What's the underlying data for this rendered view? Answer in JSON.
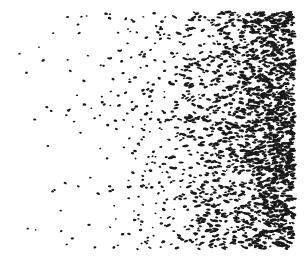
{
  "image": {
    "description": "Stippled dot-density gradient: sparse black dots on the left becoming dense elongated marks on the right",
    "width": 307,
    "height": 261,
    "background": "#ffffff",
    "ink": "#1a1a1a",
    "region": {
      "x0": 10,
      "y0": 12,
      "x1": 294,
      "y1": 249
    },
    "density": {
      "min": 0.0004,
      "max": 0.06,
      "power": 2.2
    },
    "dot_size": {
      "min": 1.2,
      "max": 2.6
    },
    "seed": 1337
  }
}
